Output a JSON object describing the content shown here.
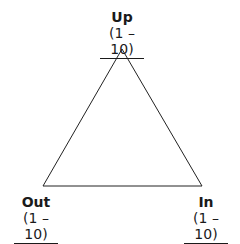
{
  "diagram": {
    "shape": "triangle",
    "stroke_color": "#222222",
    "vertices": {
      "top": {
        "label": "Up",
        "range": "(1 – 10)"
      },
      "bottom_left": {
        "label": "Out",
        "range": "(1 – 10)"
      },
      "bottom_right": {
        "label": "In",
        "range": "(1 – 10)"
      }
    }
  }
}
